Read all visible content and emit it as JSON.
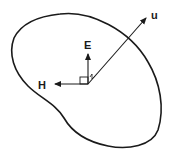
{
  "diagram": {
    "type": "vector-field-diagram",
    "stroke_color": "#1a1a1a",
    "background_color": "#ffffff",
    "origin": {
      "x": 88,
      "y": 84
    },
    "vectors": [
      {
        "id": "E",
        "label": "E",
        "from": [
          88,
          84
        ],
        "to": [
          88,
          53
        ],
        "label_pos": [
          85,
          49
        ]
      },
      {
        "id": "H",
        "label": "H",
        "from": [
          88,
          84
        ],
        "to": [
          54,
          84
        ],
        "label_pos": [
          40,
          89
        ]
      },
      {
        "id": "u",
        "label": "u",
        "from": [
          88,
          84
        ],
        "to": [
          148,
          16
        ],
        "label_pos": [
          152,
          19
        ]
      }
    ],
    "right_angle_marker": {
      "x": 80,
      "y": 77,
      "size": 8
    },
    "region": {
      "label": "",
      "closed": true
    }
  }
}
